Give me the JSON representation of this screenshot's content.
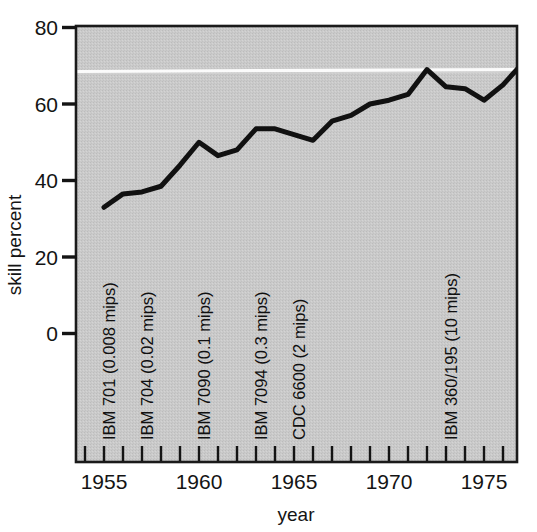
{
  "chart_data": {
    "type": "line",
    "title": "",
    "xlabel": "year",
    "ylabel": "skill percent",
    "xlim": [
      1954,
      1977
    ],
    "ylim": [
      0,
      80
    ],
    "grid": false,
    "legend": "none",
    "x_major_ticks": [
      1955,
      1960,
      1965,
      1970,
      1975
    ],
    "x_major_tick_labels": [
      "1955",
      "1960",
      "1965",
      "1970",
      "1975"
    ],
    "x_minor_tick_step": 1,
    "y_ticks": [
      0,
      20,
      40,
      60,
      80
    ],
    "y_tick_labels": [
      "0",
      "20",
      "40",
      "60",
      "80"
    ],
    "series": [
      {
        "name": "skill percent",
        "color": "#111111",
        "line_width": 5,
        "x": [
          1955,
          1956,
          1957,
          1958,
          1959,
          1960,
          1961,
          1962,
          1963,
          1964,
          1965,
          1966,
          1967,
          1968,
          1969,
          1970,
          1971,
          1972,
          1973,
          1974,
          1975,
          1976,
          1977
        ],
        "values": [
          33.0,
          36.5,
          37.0,
          38.5,
          44.0,
          50.0,
          46.5,
          48.0,
          53.5,
          53.5,
          52.0,
          50.5,
          55.5,
          57.0,
          60.0,
          61.0,
          62.5,
          69.0,
          64.5,
          64.0,
          61.0,
          65.0,
          70.5
        ]
      }
    ],
    "annotations": [
      {
        "label": "IBM 701 (0.008 mips)",
        "x": 1956,
        "orientation": "vertical"
      },
      {
        "label": "IBM 704 (0.02 mips)",
        "x": 1958,
        "orientation": "vertical"
      },
      {
        "label": "IBM 7090 (0.1 mips)",
        "x": 1961,
        "orientation": "vertical"
      },
      {
        "label": "IBM 7094 (0.3 mips)",
        "x": 1964,
        "orientation": "vertical"
      },
      {
        "label": "CDC 6600 (2 mips)",
        "x": 1966,
        "orientation": "vertical"
      },
      {
        "label": "IBM 360/195 (10 mips)",
        "x": 1973,
        "orientation": "vertical"
      }
    ],
    "style": {
      "plot_background": "#c9c9c9",
      "figure_background": "#ffffff",
      "axis_color": "#1a1a1a",
      "line_color": "#111111",
      "scan_artifact_line_color": "#fdfdfd"
    }
  },
  "axes": {
    "y_title": "skill percent",
    "x_title": "year"
  },
  "ticks": {
    "y": [
      "80",
      "60",
      "40",
      "20",
      "0"
    ],
    "x": [
      "1955",
      "1960",
      "1965",
      "1970",
      "1975"
    ]
  },
  "annotation_labels": [
    "IBM 701 (0.008 mips)",
    "IBM 704 (0.02 mips)",
    "IBM 7090 (0.1 mips)",
    "IBM 7094 (0.3 mips)",
    "CDC 6600 (2 mips)",
    "IBM 360/195 (10 mips)"
  ]
}
